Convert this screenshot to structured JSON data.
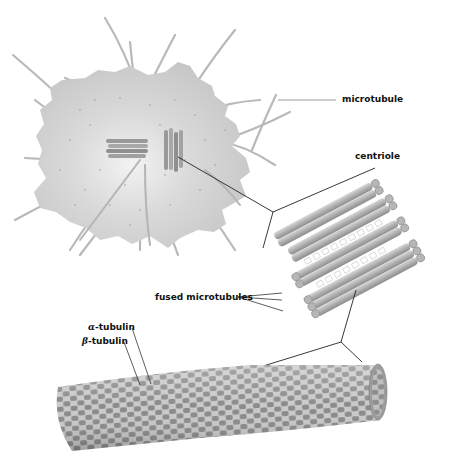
{
  "diagram": {
    "labels": {
      "microtubule": "microtubule",
      "centriole": "centriole",
      "fused_microtubules": "fused microtubules",
      "alpha_tubulin_symbol": "α",
      "alpha_tubulin_suffix": "-tubulin",
      "beta_tubulin_symbol": "β",
      "beta_tubulin_suffix": "-tubulin"
    },
    "panels": [
      {
        "name": "cell-with-centrosome",
        "description": "Cell body with radiating microtubules and central pair of centrioles"
      },
      {
        "name": "centriole-enlarged",
        "description": "Centriole cylinder of nine triplet microtubule bundles"
      },
      {
        "name": "microtubule-enlarged",
        "description": "Hollow tube of alternating alpha and beta tubulin subunits"
      }
    ],
    "colors": {
      "cell_fill": "#c9c9c9",
      "cell_center": "#ececec",
      "microtubule_fiber": "#b8b8b8",
      "tubule_light": "#c4c4c4",
      "tubule_dark": "#8f8f8f",
      "tubulin_alpha": "#bdbdbd",
      "tubulin_beta": "#8a8a8a",
      "leader_line": "#222222",
      "label_text": "#111111"
    }
  }
}
